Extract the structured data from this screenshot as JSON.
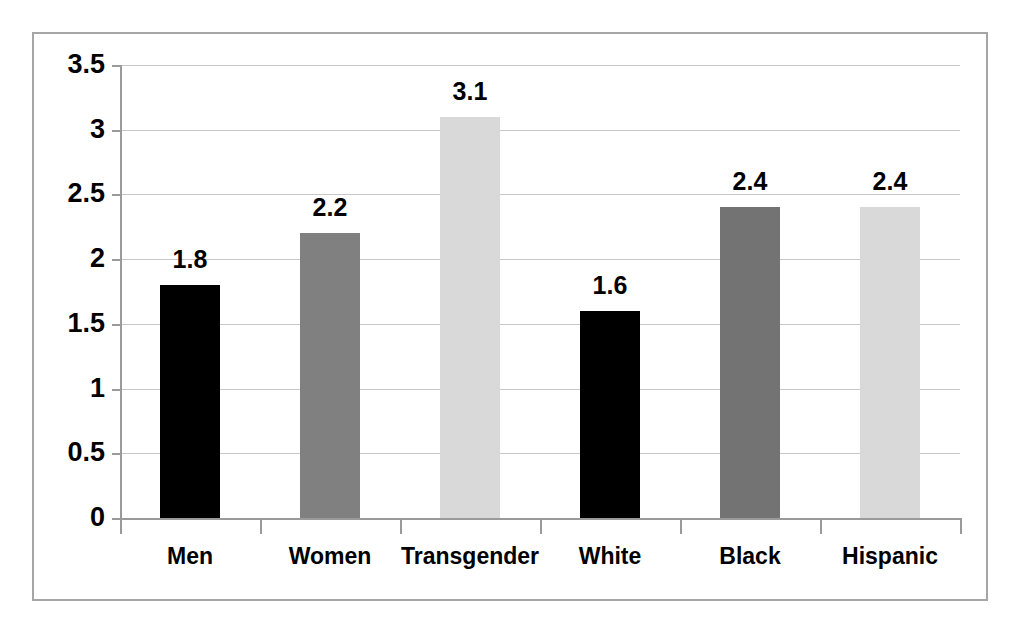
{
  "chart_data": {
    "type": "bar",
    "title": "",
    "subtitle": "",
    "xlabel": "",
    "ylabel": "",
    "categories": [
      "Men",
      "Women",
      "Transgender",
      "White",
      "Black",
      "Hispanic"
    ],
    "values": [
      1.8,
      2.2,
      3.1,
      1.6,
      2.4,
      2.4
    ],
    "value_labels": [
      "1.8",
      "2.2",
      "3.1",
      "1.6",
      "2.4",
      "2.4"
    ],
    "bar_colors": [
      "#000000",
      "#808080",
      "#d9d9d9",
      "#000000",
      "#737373",
      "#d9d9d9"
    ],
    "ylim": [
      0,
      3.5
    ],
    "ytick_values": [
      0,
      0.5,
      1,
      1.5,
      2,
      2.5,
      3,
      3.5
    ],
    "ytick_labels": [
      "0",
      "0.5",
      "1",
      "1.5",
      "2",
      "2.5",
      "3",
      "3.5"
    ],
    "grid": true,
    "grid_axis": "y",
    "legend": false,
    "legend_position": "none",
    "series": [
      {
        "name": "Series 1",
        "values": [
          1.8,
          2.2,
          3.1,
          1.6,
          2.4,
          2.4
        ]
      }
    ],
    "annotations": [],
    "colors": {
      "gridline": "#c8c8c8",
      "axis": "#9a9a9a",
      "frame": "#a6a6a6",
      "text": "#000000",
      "background": "#ffffff"
    }
  }
}
